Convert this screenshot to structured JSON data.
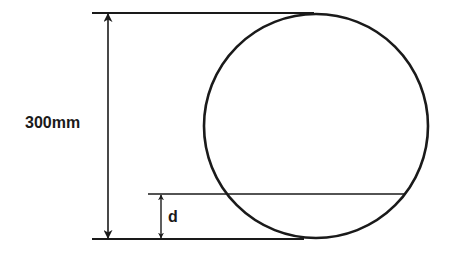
{
  "diagram": {
    "type": "dimensioned-circle",
    "colors": {
      "stroke": "#1a1a1a",
      "background": "#ffffff"
    },
    "circle": {
      "cx": 316,
      "cy": 126,
      "r": 112
    },
    "lines": {
      "top": {
        "x1": 92,
        "x2": 314,
        "y": 13
      },
      "bottom": {
        "x1": 92,
        "x2": 304,
        "y": 239
      },
      "d_level": {
        "x1": 148,
        "x2": 404,
        "y": 194
      }
    },
    "dimensions": {
      "diameter": {
        "label": "300mm",
        "x": 108,
        "y1": 13,
        "y2": 239
      },
      "depth": {
        "label": "d",
        "x": 161,
        "y1": 194,
        "y2": 239
      }
    }
  }
}
